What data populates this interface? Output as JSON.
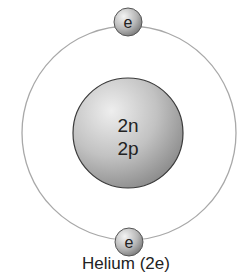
{
  "diagram": {
    "title": "Helium (2e)",
    "nucleus": {
      "line1": "2n",
      "line2": "2p"
    },
    "electrons": [
      {
        "label": "e",
        "position": "top"
      },
      {
        "label": "e",
        "position": "bottom"
      }
    ]
  },
  "colors": {
    "orbit": "#a8a8a8",
    "nucleus_light": "#e2e2e2",
    "nucleus_dark": "#8a8a8a",
    "text": "#222222"
  }
}
